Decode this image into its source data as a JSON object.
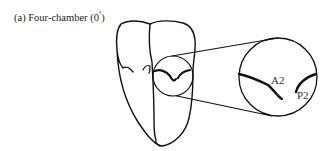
{
  "figure": {
    "title_prefix": "(a) Four-chamber (0",
    "title_degree": "°",
    "title_suffix": ")",
    "labels": {
      "a2": "A2",
      "p2": "P2"
    },
    "stroke_color": "#111111",
    "background": "#ffffff"
  }
}
